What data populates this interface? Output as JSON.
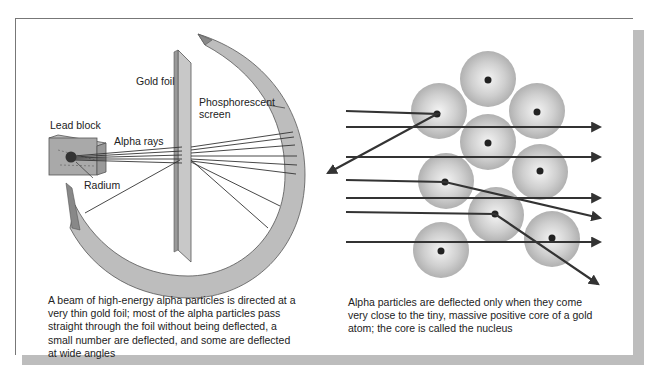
{
  "left_figure": {
    "labels": {
      "gold_foil": "Gold foil",
      "phosphorescent_screen_line1": "Phosphorescent",
      "phosphorescent_screen_line2": "screen",
      "lead_block": "Lead block",
      "alpha_rays": "Alpha rays",
      "radium": "Radium"
    },
    "caption": "A beam of high-energy alpha particles is directed at a very thin gold foil; most of the alpha particles pass straight through the foil without being deflected, a small number are deflected, and some are deflected at wide angles"
  },
  "right_figure": {
    "caption": "Alpha particles are deflected only when they come very close to the tiny, massive positive core of a gold atom; the core is called the nucleus",
    "atom_count": 9,
    "alpha_path_count": 8
  },
  "colors": {
    "line": "#333333",
    "atom_fill": "#c4c4c4",
    "screen_fill": "#bdbdbd",
    "shadow": "#bdbdbd"
  }
}
